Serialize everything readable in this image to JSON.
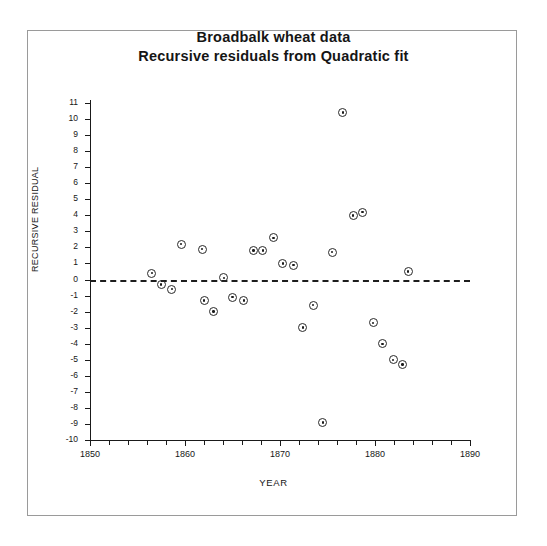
{
  "chart_data": {
    "type": "scatter",
    "title": "Broadbalk wheat data",
    "subtitle": "Recursive residuals from Quadratic fit",
    "xlabel": "YEAR",
    "ylabel": "RECURSIVE RESIDUAL",
    "xlim": [
      1850,
      1890
    ],
    "ylim": [
      -10,
      11
    ],
    "xticks": [
      1850,
      1860,
      1870,
      1880,
      1890
    ],
    "xtick_labels": [
      "1850",
      "1860",
      "1870",
      "1880",
      "1890"
    ],
    "x_minor_tick_interval": 2,
    "yticks": [
      11,
      10,
      9,
      8,
      7,
      6,
      5,
      4,
      3,
      2,
      1,
      0,
      -1,
      -2,
      -3,
      -4,
      -5,
      -6,
      -7,
      -8,
      -9,
      -10
    ],
    "ytick_labels": [
      "11",
      "10",
      "9",
      "8",
      "7",
      "6",
      "5",
      "4",
      "3",
      "2",
      "1",
      "0",
      "-1",
      "-2",
      "-3",
      "-4",
      "-5",
      "-6",
      "-7",
      "-8",
      "-9",
      "-10"
    ],
    "grid": false,
    "legend": null,
    "reference_line": {
      "y": 0,
      "style": "dashed",
      "color": "#1d1d1d"
    },
    "marker": "circle-with-center-dot",
    "marker_color": "#2a2a2a",
    "x": [
      1856.5,
      1857.5,
      1858.6,
      1859.6,
      1861.8,
      1862.0,
      1863.0,
      1864.1,
      1865.0,
      1866.2,
      1867.2,
      1868.2,
      1869.3,
      1870.3,
      1871.4,
      1872.4,
      1873.5,
      1874.5,
      1875.5,
      1876.6,
      1877.7,
      1878.7,
      1879.8,
      1880.8,
      1881.9,
      1882.9,
      1883.5
    ],
    "y": [
      0.4,
      -0.3,
      -0.6,
      2.2,
      1.9,
      -1.3,
      -2.0,
      0.1,
      -1.1,
      -1.3,
      1.8,
      1.8,
      2.6,
      1.0,
      0.9,
      -3.0,
      -1.6,
      -8.9,
      1.7,
      10.4,
      4.0,
      4.2,
      -2.7,
      -4.0,
      -5.0,
      -5.3,
      0.5
    ],
    "points": [
      {
        "year": 1856.5,
        "residual": 0.4
      },
      {
        "year": 1857.5,
        "residual": -0.3
      },
      {
        "year": 1858.6,
        "residual": -0.6
      },
      {
        "year": 1859.6,
        "residual": 2.2
      },
      {
        "year": 1861.8,
        "residual": 1.9
      },
      {
        "year": 1862.0,
        "residual": -1.3
      },
      {
        "year": 1863.0,
        "residual": -2.0
      },
      {
        "year": 1864.1,
        "residual": 0.1
      },
      {
        "year": 1865.0,
        "residual": -1.1
      },
      {
        "year": 1866.2,
        "residual": -1.3
      },
      {
        "year": 1867.2,
        "residual": 1.8
      },
      {
        "year": 1868.2,
        "residual": 1.8
      },
      {
        "year": 1869.3,
        "residual": 2.6
      },
      {
        "year": 1870.3,
        "residual": 1.0
      },
      {
        "year": 1871.4,
        "residual": 0.9
      },
      {
        "year": 1872.4,
        "residual": -3.0
      },
      {
        "year": 1873.5,
        "residual": -1.6
      },
      {
        "year": 1874.5,
        "residual": -8.9
      },
      {
        "year": 1875.5,
        "residual": 1.7
      },
      {
        "year": 1876.6,
        "residual": 10.4
      },
      {
        "year": 1877.7,
        "residual": 4.0
      },
      {
        "year": 1878.7,
        "residual": 4.2
      },
      {
        "year": 1879.8,
        "residual": -2.7
      },
      {
        "year": 1880.8,
        "residual": -4.0
      },
      {
        "year": 1881.9,
        "residual": -5.0
      },
      {
        "year": 1882.9,
        "residual": -5.3
      },
      {
        "year": 1883.5,
        "residual": 0.5
      }
    ]
  }
}
